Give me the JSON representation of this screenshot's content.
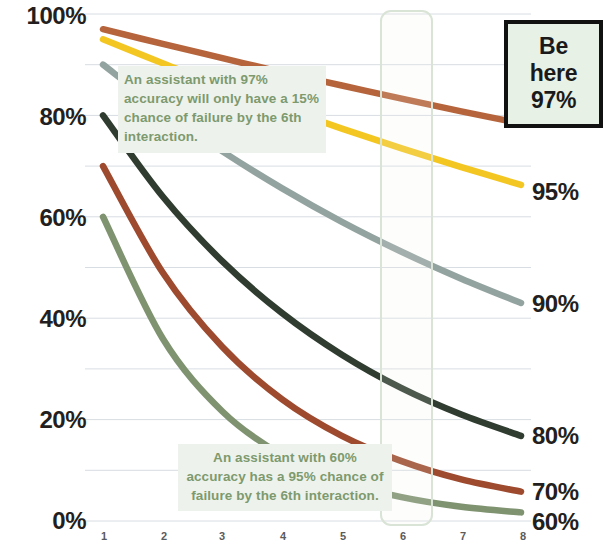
{
  "chart_data": {
    "type": "line",
    "title": "",
    "subtitle": "",
    "xlabel": "",
    "ylabel": "",
    "x": [
      1,
      2,
      3,
      4,
      5,
      6,
      7,
      8
    ],
    "xticklabels": [
      "1",
      "2",
      "3",
      "4",
      "5",
      "6",
      "7",
      "8"
    ],
    "yticklabels": [
      "0%",
      "20%",
      "40%",
      "60%",
      "80%",
      "100%"
    ],
    "ytickvalues": [
      0,
      20,
      40,
      60,
      80,
      100
    ],
    "ylim": [
      0,
      100
    ],
    "xlim": [
      1,
      8
    ],
    "grid": true,
    "gridlines_every": 10,
    "legend_position": "right-end-labels",
    "series": [
      {
        "name": "97%",
        "color": "#b5643c",
        "end_label": "97%",
        "values": [
          97,
          94.1,
          91.3,
          88.5,
          85.9,
          83.3,
          80.8,
          78.4
        ]
      },
      {
        "name": "95%",
        "color": "#f3c622",
        "end_label": "95%",
        "values": [
          95,
          90.3,
          85.7,
          81.5,
          77.4,
          73.5,
          69.8,
          66.3
        ]
      },
      {
        "name": "90%",
        "color": "#93a3a0",
        "end_label": "90%",
        "values": [
          90,
          81,
          72.9,
          65.6,
          59.0,
          53.1,
          47.8,
          43.0
        ]
      },
      {
        "name": "80%",
        "color": "#2f3c2f",
        "end_label": "80%",
        "values": [
          80,
          64,
          51.2,
          41.0,
          32.8,
          26.2,
          21.0,
          16.8
        ]
      },
      {
        "name": "70%",
        "color": "#9d4a2f",
        "end_label": "70%",
        "values": [
          70,
          49,
          34.3,
          24.0,
          16.8,
          11.8,
          8.2,
          5.8
        ]
      },
      {
        "name": "60%",
        "color": "#7f9370",
        "end_label": "60%",
        "values": [
          60,
          36,
          21.6,
          13.0,
          7.8,
          4.7,
          2.8,
          1.7
        ]
      }
    ],
    "annotations": [
      {
        "id": "annot-97",
        "text": "An assistant with 97% accuracy will only have a 15% chance of failure by the 6th interaction.",
        "align": "left",
        "bg_color": "#eef2ec",
        "text_color": "#7d9a6e"
      },
      {
        "id": "annot-60",
        "text": "An assistant with 60% accuracy has a 95% chance of failure by the 6th interaction.",
        "align": "center",
        "bg_color": "#eef2ec",
        "text_color": "#7d9a6e"
      }
    ],
    "callout_box": {
      "line1": "Be",
      "line2": "here",
      "line3": "97%",
      "bg_color": "#e8f1e6",
      "border_color": "#111111"
    },
    "highlight_column": {
      "x_value": 6,
      "border_color": "#d9e3d6"
    }
  },
  "axis": {
    "left_labels": [
      "100%",
      "80%",
      "60%",
      "40%",
      "20%",
      "0%"
    ],
    "right_labels": [
      "95%",
      "90%",
      "80%",
      "70%",
      "60%"
    ],
    "bottom_labels": [
      "1",
      "2",
      "3",
      "4",
      "5",
      "6",
      "7",
      "8"
    ]
  }
}
